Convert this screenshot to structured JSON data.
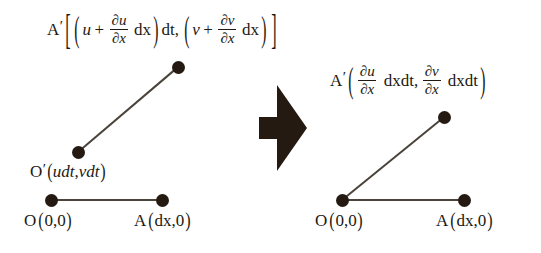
{
  "figure": {
    "background_color": "#ffffff",
    "ink_color": "#221a12",
    "line_color": "#4a433c"
  },
  "left_panel": {
    "name": "before-deformation-panel",
    "formula_Aprime": {
      "label": "A",
      "prime": "′",
      "open_bracket": "[",
      "term1": {
        "open_paren": "(",
        "var": "u",
        "plus": "+",
        "frac_num": "∂u",
        "frac_den": "∂x",
        "differential": "dx",
        "close_paren": ")",
        "trailing": "dt"
      },
      "comma": ",",
      "term2": {
        "open_paren": "(",
        "var": "v",
        "plus": "+",
        "frac_num": "∂v",
        "frac_den": "∂x",
        "differential": "dx",
        "close_paren": ")"
      },
      "close_bracket": "]",
      "plain_text": "A′[(u + ∂u/∂x dx)dt, (v + ∂v/∂x dx)]"
    },
    "label_Oprime": {
      "point": "O",
      "prime": "′",
      "open_paren": "(",
      "coord_x": "udt",
      "comma": ",",
      "coord_y": "vdt",
      "close_paren": ")",
      "plain_text": "O′(udt, vdt)"
    },
    "label_O": {
      "point": "O",
      "open_paren": "(",
      "coord_x": "0",
      "comma": ",",
      "coord_y": "0",
      "close_paren": ")",
      "plain_text": "O(0,0)"
    },
    "label_A": {
      "point": "A",
      "open_paren": "(",
      "coord_x": "dx",
      "comma": ",",
      "coord_y": "0",
      "close_paren": ")",
      "plain_text": "A(dx,0)"
    },
    "points": {
      "O": {
        "x": 51,
        "y": 200
      },
      "A": {
        "x": 162,
        "y": 200
      },
      "Oprime": {
        "x": 78,
        "y": 152
      },
      "Aprime": {
        "x": 178,
        "y": 67
      }
    },
    "segments": [
      {
        "name": "segment-OA",
        "x1": 51,
        "y1": 200,
        "x2": 162,
        "y2": 200
      },
      {
        "name": "segment-Oprime-Aprime",
        "x1": 78,
        "y1": 152,
        "x2": 178,
        "y2": 67
      }
    ]
  },
  "arrow": {
    "name": "transformation-arrow",
    "direction": "right",
    "color": "#241a11",
    "x": 259,
    "y": 85,
    "width": 48,
    "height": 86
  },
  "right_panel": {
    "name": "after-deformation-panel",
    "formula_Aprime": {
      "label": "A",
      "prime": "′",
      "open_paren": "(",
      "term1": {
        "frac_num": "∂u",
        "frac_den": "∂x",
        "differential": "dxdt"
      },
      "comma": ",",
      "term2": {
        "frac_num": "∂v",
        "frac_den": "∂x",
        "differential": "dxdt"
      },
      "close_paren": ")",
      "plain_text": "A′(∂u/∂x dxdt, ∂v/∂x dxdt)"
    },
    "label_O": {
      "point": "O",
      "open_paren": "(",
      "coord_x": "0",
      "comma": ",",
      "coord_y": "0",
      "close_paren": ")",
      "plain_text": "O(0,0)"
    },
    "label_A": {
      "point": "A",
      "open_paren": "(",
      "coord_x": "dx",
      "comma": ",",
      "coord_y": "0",
      "close_paren": ")",
      "plain_text": "A(dx,0)"
    },
    "points": {
      "O": {
        "x": 342,
        "y": 200
      },
      "A": {
        "x": 464,
        "y": 200
      },
      "Aprime": {
        "x": 444,
        "y": 117
      }
    },
    "segments": [
      {
        "name": "segment-OA",
        "x1": 342,
        "y1": 200,
        "x2": 464,
        "y2": 200
      },
      {
        "name": "segment-O-Aprime",
        "x1": 342,
        "y1": 200,
        "x2": 444,
        "y2": 117
      }
    ]
  }
}
